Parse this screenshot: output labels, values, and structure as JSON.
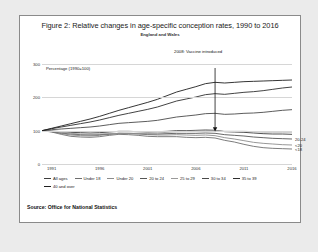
{
  "figure": {
    "title": "Figure 2: Relative changes in age-specific conception rates, 1990 to 2016",
    "subtitle": "England and Wales",
    "source": "Source: Office for National Statistics"
  },
  "chart_data": {
    "type": "line",
    "title": "Figure 2: Relative changes in age-specific conception rates, 1990 to 2016",
    "subtitle": "England and Wales",
    "xlabel": "",
    "ylabel": "Percentage (1990=100)",
    "ylim": [
      0,
      300
    ],
    "yticks": [
      0,
      100,
      200,
      300
    ],
    "xticks": [
      1991,
      1996,
      2001,
      2006,
      2011,
      2016
    ],
    "xlim": [
      1990,
      2016
    ],
    "grid": true,
    "legend_position": "bottom",
    "annotations": [
      {
        "text": "2008: Vaccine introduced",
        "x": 2008,
        "y": 100,
        "arrow": "down"
      }
    ],
    "right_labels": [
      {
        "text": "20-24",
        "value": 75
      },
      {
        "text": "<20",
        "value": 57
      },
      {
        "text": "<18",
        "value": 45
      }
    ],
    "x": [
      1990,
      1991,
      1992,
      1993,
      1994,
      1995,
      1996,
      1997,
      1998,
      1999,
      2000,
      2001,
      2002,
      2003,
      2004,
      2005,
      2006,
      2007,
      2008,
      2009,
      2010,
      2011,
      2012,
      2013,
      2014,
      2015,
      2016
    ],
    "series": [
      {
        "name": "All ages",
        "color": "#3d3d3d",
        "values": [
          100,
          99,
          97,
          95,
          94,
          93,
          94,
          96,
          98,
          98,
          97,
          96,
          97,
          98,
          100,
          100,
          101,
          102,
          101,
          97,
          96,
          95,
          93,
          91,
          90,
          90,
          89
        ]
      },
      {
        "name": "Under 18",
        "color": "#6e6e6e",
        "values": [
          100,
          96,
          89,
          83,
          81,
          80,
          82,
          86,
          89,
          88,
          86,
          83,
          82,
          82,
          82,
          80,
          79,
          80,
          78,
          71,
          66,
          59,
          53,
          49,
          47,
          46,
          45
        ]
      },
      {
        "name": "Under 20",
        "color": "#8c8c8c",
        "values": [
          100,
          97,
          91,
          87,
          85,
          84,
          86,
          89,
          92,
          91,
          90,
          88,
          87,
          87,
          88,
          87,
          86,
          87,
          85,
          79,
          75,
          70,
          65,
          62,
          60,
          58,
          57
        ]
      },
      {
        "name": "20 to 24",
        "color": "#565656",
        "values": [
          100,
          97,
          93,
          90,
          88,
          87,
          88,
          90,
          92,
          92,
          91,
          90,
          90,
          91,
          92,
          92,
          92,
          93,
          92,
          88,
          86,
          84,
          81,
          79,
          77,
          76,
          75
        ]
      },
      {
        "name": "25 to 29",
        "color": "#9a9a9a",
        "values": [
          100,
          98,
          95,
          92,
          90,
          89,
          90,
          91,
          92,
          92,
          92,
          92,
          93,
          95,
          97,
          98,
          99,
          101,
          101,
          98,
          98,
          98,
          97,
          96,
          96,
          96,
          96
        ]
      },
      {
        "name": "30 to 34",
        "color": "#4a4a4a",
        "values": [
          100,
          103,
          105,
          107,
          109,
          111,
          114,
          118,
          122,
          124,
          126,
          128,
          131,
          136,
          141,
          144,
          147,
          151,
          152,
          149,
          150,
          152,
          153,
          155,
          158,
          161,
          163
        ]
      },
      {
        "name": "35 to 39",
        "color": "#2e2e2e",
        "values": [
          100,
          106,
          111,
          116,
          121,
          126,
          132,
          139,
          146,
          152,
          158,
          164,
          171,
          180,
          189,
          195,
          201,
          208,
          211,
          209,
          212,
          215,
          217,
          220,
          224,
          228,
          231
        ]
      },
      {
        "name": "40 and over",
        "color": "#1f1f1f",
        "values": [
          100,
          107,
          114,
          121,
          128,
          135,
          143,
          152,
          161,
          169,
          177,
          185,
          194,
          205,
          216,
          224,
          232,
          241,
          245,
          243,
          245,
          247,
          248,
          249,
          250,
          251,
          252
        ]
      }
    ]
  }
}
